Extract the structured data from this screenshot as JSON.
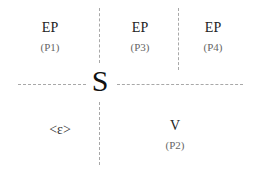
{
  "diagram": {
    "center_label": "S",
    "cells": [
      {
        "id": "top-left",
        "label": "EP",
        "sub": "(P1)"
      },
      {
        "id": "top-middle",
        "label": "EP",
        "sub": "(P3)"
      },
      {
        "id": "top-right",
        "label": "EP",
        "sub": "(P4)"
      },
      {
        "id": "bottom-left",
        "label": "<ε>",
        "sub": ""
      },
      {
        "id": "bottom-right",
        "label": "V",
        "sub": "(P2)"
      }
    ],
    "line_color": "#a8a8a8"
  }
}
